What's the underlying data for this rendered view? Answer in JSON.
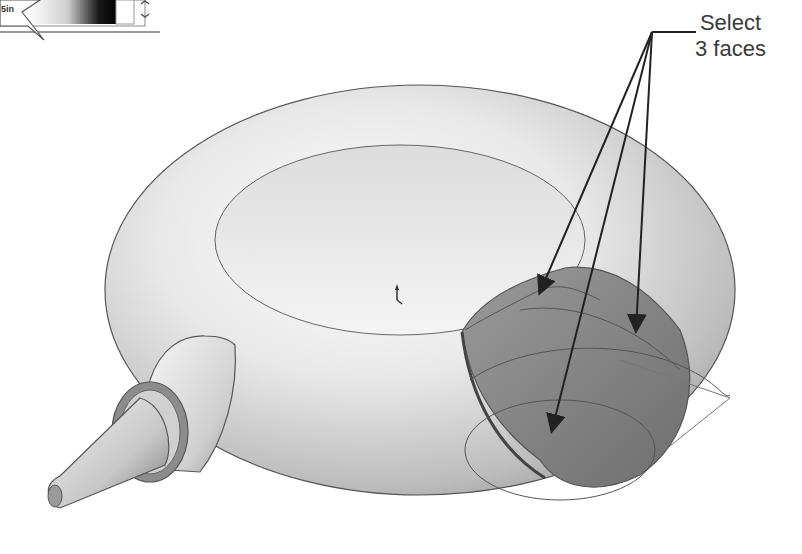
{
  "widget": {
    "value_label": "5in",
    "stepper_up": "up",
    "stepper_down": "down"
  },
  "annotation": {
    "line1": "Select",
    "line2": "3 faces"
  },
  "colors": {
    "highlight_face": "#8a8a8a",
    "body_shade": "#d9d9d9",
    "arrow": "#222222"
  }
}
